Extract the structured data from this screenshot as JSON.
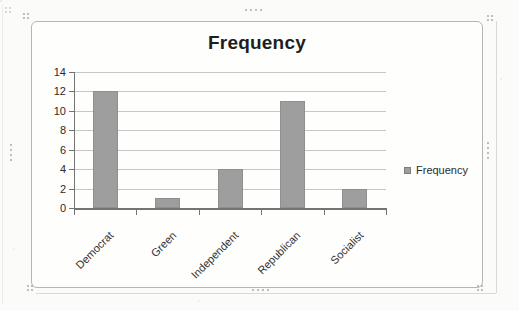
{
  "chart_data": {
    "type": "bar",
    "title": "Frequency",
    "categories": [
      "Democrat",
      "Green",
      "Independent",
      "Republican",
      "Socialist"
    ],
    "values": [
      12,
      1,
      4,
      11,
      2
    ],
    "series": [
      {
        "name": "Frequency",
        "values": [
          12,
          1,
          4,
          11,
          2
        ]
      }
    ],
    "xlabel": "",
    "ylabel": "",
    "ylim": [
      0,
      14
    ],
    "yticks": [
      0,
      2,
      4,
      6,
      8,
      10,
      12,
      14
    ],
    "grid": true,
    "legend": {
      "entries": [
        "Frequency"
      ],
      "position": "right"
    }
  },
  "colors": {
    "bar_fill": "#9e9e9e",
    "bar_border": "#8f8f8f",
    "gridline": "#c6c6c6",
    "axis": "#747474",
    "title_text": "#1e1e1e",
    "tick_text": "#2b2b2b",
    "frame_border": "#b6b6b6",
    "page_background": "#fbfbf9"
  }
}
